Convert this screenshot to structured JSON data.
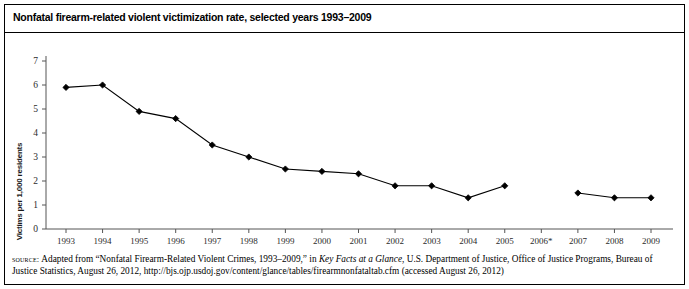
{
  "figure": {
    "title": "Nonfatal firearm-related violent victimization rate, selected years 1993–2009",
    "source_label": "source:",
    "source_part1": " Adapted from “Nonfatal Firearm-Related Violent Crimes, 1993–2009,” in ",
    "source_italic": "Key Facts at a Glance",
    "source_part2": ", U.S. Department of Justice, Office of Justice Programs, Bureau of Justice Statistics, August 26, 2012, http://bjs.ojp.usdoj.gov/content/glance/tables/firearmnonfataltab.cfm (accessed August 26, 2012)"
  },
  "chart_data": {
    "type": "line",
    "title": "Nonfatal firearm-related violent victimization rate, selected years 1993–2009",
    "xlabel": "",
    "ylabel": "Victims per 1,000 residents",
    "categories": [
      "1993",
      "1994",
      "1995",
      "1996",
      "1997",
      "1998",
      "1999",
      "2000",
      "2001",
      "2002",
      "2003",
      "2004",
      "2005",
      "2006*",
      "2007",
      "2008",
      "2009"
    ],
    "values": [
      5.9,
      6.0,
      4.9,
      4.6,
      3.5,
      3.0,
      2.5,
      2.4,
      2.3,
      1.8,
      1.8,
      1.3,
      1.8,
      null,
      1.5,
      1.3,
      1.3
    ],
    "ylim": [
      0,
      7
    ],
    "yticks": [
      0,
      1,
      2,
      3,
      4,
      5,
      6,
      7
    ],
    "ytick_labels": [
      "0",
      "1",
      "2",
      "3",
      "4",
      "5",
      "6",
      "7"
    ],
    "grid": false,
    "legend": "none",
    "marker": "diamond",
    "line_color": "#000000",
    "marker_color": "#000000",
    "note": "No data point plotted for 2006*; line is broken between 2005 and 2007."
  }
}
